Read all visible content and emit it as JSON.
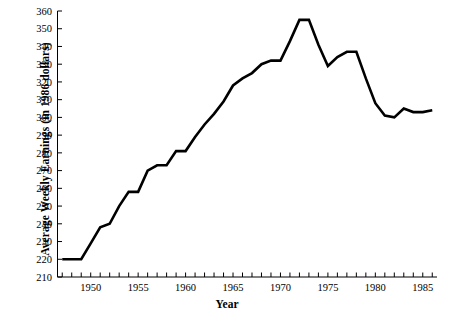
{
  "chart_data": {
    "type": "line",
    "title": "",
    "xlabel": "Year",
    "ylabel": "Average Weekly Earnings (in 1986 dollars)",
    "xlim": [
      1946.5,
      1986.5
    ],
    "ylim": [
      210,
      360
    ],
    "grid": false,
    "legend": null,
    "y_ticks": [
      210,
      220,
      230,
      240,
      250,
      260,
      270,
      280,
      290,
      300,
      310,
      320,
      330,
      340,
      350,
      360
    ],
    "y_tick_labels": [
      "210",
      "220",
      "230",
      "240",
      "250",
      "260",
      "270",
      "280",
      "290",
      "300",
      "310",
      "320",
      "330",
      "340",
      "350",
      "360"
    ],
    "x_ticks": [
      1947,
      1948,
      1949,
      1950,
      1951,
      1952,
      1953,
      1954,
      1955,
      1956,
      1957,
      1958,
      1959,
      1960,
      1961,
      1962,
      1963,
      1964,
      1965,
      1966,
      1967,
      1968,
      1969,
      1970,
      1971,
      1972,
      1973,
      1974,
      1975,
      1976,
      1977,
      1978,
      1979,
      1980,
      1981,
      1982,
      1983,
      1984,
      1985,
      1986
    ],
    "x_tick_labels": [
      "1950",
      "1955",
      "1960",
      "1965",
      "1970",
      "1975",
      "1980",
      "1985"
    ],
    "x_labeled_ticks": [
      1950,
      1955,
      1960,
      1965,
      1970,
      1975,
      1980,
      1985
    ],
    "line_color": "#000000",
    "line_width": 2.6,
    "x": [
      1947,
      1948,
      1949,
      1950,
      1951,
      1952,
      1953,
      1954,
      1955,
      1956,
      1957,
      1958,
      1959,
      1960,
      1961,
      1962,
      1963,
      1964,
      1965,
      1966,
      1967,
      1968,
      1969,
      1970,
      1971,
      1972,
      1973,
      1974,
      1975,
      1976,
      1977,
      1978,
      1979,
      1980,
      1981,
      1982,
      1983,
      1984,
      1985,
      1986
    ],
    "values": [
      220,
      220,
      220,
      229,
      238,
      240,
      250,
      258,
      258,
      270,
      273,
      273,
      281,
      281,
      289,
      296,
      302,
      309,
      318,
      322,
      325,
      330,
      332,
      332,
      343,
      355,
      355,
      341,
      329,
      334,
      337,
      337,
      322,
      308,
      301,
      300,
      305,
      303,
      303,
      304
    ],
    "series": [
      {
        "name": "Average Weekly Earnings",
        "values": [
          220,
          220,
          220,
          229,
          238,
          240,
          250,
          258,
          258,
          270,
          273,
          273,
          281,
          281,
          289,
          296,
          302,
          309,
          318,
          322,
          325,
          330,
          332,
          332,
          343,
          355,
          355,
          341,
          329,
          334,
          337,
          337,
          322,
          308,
          301,
          300,
          305,
          303,
          303,
          304
        ]
      }
    ]
  },
  "axes": {
    "y_axis_label": "Average Weekly Earnings (in 1986 dollars)",
    "x_axis_label": "Year"
  }
}
